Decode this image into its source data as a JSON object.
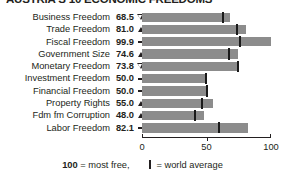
{
  "chart_data": {
    "type": "bar",
    "title": "AUSTRIA'S 10 ECONOMIC FREEDOMS",
    "xlabel": "",
    "ylabel": "",
    "xlim": [
      0,
      100
    ],
    "grid": false,
    "orientation": "horizontal",
    "legend_position": "bottom",
    "categories": [
      "Business Freedom",
      "Trade Freedom",
      "Fiscal Freedom",
      "Government Size",
      "Monetary Freedom",
      "Investment Freedom",
      "Financial Freedom",
      "Property Rights",
      "Fdm fm Corruption",
      "Labor Freedom"
    ],
    "values": [
      68.5,
      81.0,
      99.9,
      74.6,
      73.8,
      50.0,
      50.0,
      55.0,
      48.0,
      82.1
    ],
    "value_labels": [
      "68.5",
      "81.0",
      "99.9",
      "74.6",
      "73.8",
      "50.0",
      "50.0",
      "55.0",
      "48.0",
      "82.1"
    ],
    "trend": [
      "down",
      "up",
      "flat",
      "up",
      "down",
      "flat",
      "flat",
      "up",
      "up",
      "flat"
    ],
    "world_average": [
      62.0,
      73.0,
      75.5,
      66.5,
      73.8,
      49.0,
      49.5,
      46.0,
      40.5,
      59.0
    ],
    "ticks": [
      0,
      50,
      100
    ],
    "tick_labels": [
      "0",
      "50",
      "100"
    ],
    "series": [
      {
        "name": "Country score",
        "values": [
          68.5,
          81.0,
          99.9,
          74.6,
          73.8,
          50.0,
          50.0,
          55.0,
          48.0,
          82.1
        ]
      },
      {
        "name": "World average",
        "values": [
          62.0,
          73.0,
          75.5,
          66.5,
          73.8,
          49.0,
          49.5,
          46.0,
          40.5,
          59.0
        ]
      }
    ],
    "colors": {
      "bar": "#8c8c8c",
      "marker": "#1a1a1a",
      "text": "#231f20",
      "background": "#ffffff"
    }
  },
  "legend": {
    "most_free_number": "100",
    "most_free_text": "= most free,",
    "world_average_text": "= world average"
  }
}
